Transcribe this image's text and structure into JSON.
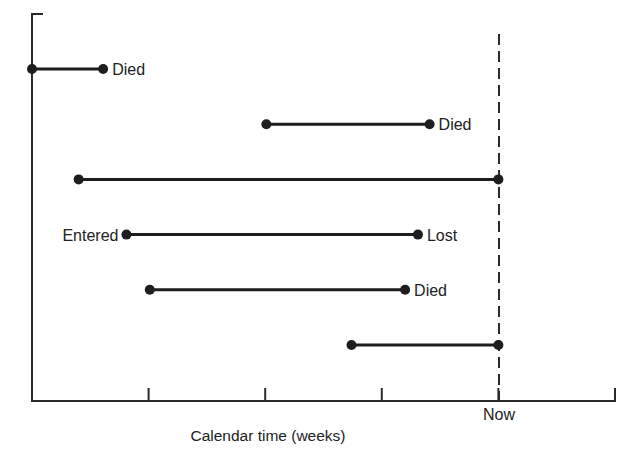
{
  "figure": {
    "x_axis_title": "Calendar time (weeks)",
    "now_label": "Now"
  },
  "chart_data": {
    "type": "timeline",
    "title": "",
    "xlabel": "Calendar time (weeks)",
    "ylabel": "",
    "x_unit_note": "positions in tick intervals from the origin; axis has no numeric tick labels",
    "xlim": [
      0,
      5
    ],
    "ticks": [
      0,
      1,
      2,
      3,
      4,
      5
    ],
    "now": 4,
    "grid": false,
    "legend": null,
    "subjects": [
      {
        "row": 1,
        "start": 0.0,
        "end": 0.61,
        "start_label": "",
        "end_label": "Died"
      },
      {
        "row": 2,
        "start": 2.01,
        "end": 3.41,
        "start_label": "",
        "end_label": "Died"
      },
      {
        "row": 3,
        "start": 0.4,
        "end": 4.0,
        "start_label": "",
        "end_label": ""
      },
      {
        "row": 4,
        "start": 0.81,
        "end": 3.31,
        "start_label": "Entered",
        "end_label": "Lost"
      },
      {
        "row": 5,
        "start": 1.01,
        "end": 3.2,
        "start_label": "",
        "end_label": "Died"
      },
      {
        "row": 6,
        "start": 2.74,
        "end": 4.0,
        "start_label": "",
        "end_label": ""
      }
    ]
  }
}
